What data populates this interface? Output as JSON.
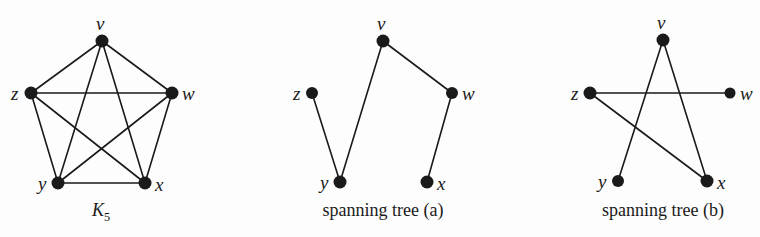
{
  "figure": {
    "background_color": "#fdfdfd",
    "ink_color": "#1a1a1a",
    "panels": [
      {
        "id": "k5",
        "caption": "K",
        "caption_subscript": "5",
        "caption_full": "K5",
        "vertices": [
          {
            "name": "v",
            "label": "v",
            "cx": 102,
            "cy": 41,
            "r": 6.5,
            "label_x": 96,
            "label_y": 14
          },
          {
            "name": "z",
            "label": "z",
            "cx": 31,
            "cy": 93,
            "r": 6.5,
            "label_x": 11,
            "label_y": 84
          },
          {
            "name": "w",
            "label": "w",
            "cx": 172,
            "cy": 93,
            "r": 6.5,
            "label_x": 182,
            "label_y": 84
          },
          {
            "name": "y",
            "label": "y",
            "cx": 58,
            "cy": 183,
            "r": 6.5,
            "label_x": 38,
            "label_y": 174
          },
          {
            "name": "x",
            "label": "x",
            "cx": 145,
            "cy": 183,
            "r": 6.5,
            "label_x": 155,
            "label_y": 175
          }
        ],
        "edges": [
          [
            "v",
            "z"
          ],
          [
            "v",
            "w"
          ],
          [
            "v",
            "y"
          ],
          [
            "v",
            "x"
          ],
          [
            "z",
            "w"
          ],
          [
            "z",
            "y"
          ],
          [
            "z",
            "x"
          ],
          [
            "w",
            "y"
          ],
          [
            "w",
            "x"
          ],
          [
            "y",
            "x"
          ]
        ],
        "edge_count": 10
      },
      {
        "id": "spanning-tree-a",
        "caption": "spanning tree (a)",
        "vertices": [
          {
            "name": "v",
            "label": "v",
            "cx": 383,
            "cy": 41,
            "r": 6.5,
            "label_x": 377,
            "label_y": 14
          },
          {
            "name": "z",
            "label": "z",
            "cx": 312,
            "cy": 93,
            "r": 6.0,
            "label_x": 293,
            "label_y": 84
          },
          {
            "name": "w",
            "label": "w",
            "cx": 452,
            "cy": 93,
            "r": 6.0,
            "label_x": 462,
            "label_y": 84
          },
          {
            "name": "y",
            "label": "y",
            "cx": 340,
            "cy": 182,
            "r": 6.5,
            "label_x": 320,
            "label_y": 173
          },
          {
            "name": "x",
            "label": "x",
            "cx": 427,
            "cy": 182,
            "r": 6.5,
            "label_x": 437,
            "label_y": 174
          }
        ],
        "edges": [
          [
            "z",
            "y"
          ],
          [
            "y",
            "v"
          ],
          [
            "v",
            "w"
          ],
          [
            "w",
            "x"
          ]
        ],
        "edge_count": 4
      },
      {
        "id": "spanning-tree-b",
        "caption": "spanning tree (b)",
        "vertices": [
          {
            "name": "v",
            "label": "v",
            "cx": 663,
            "cy": 40,
            "r": 6.5,
            "label_x": 657,
            "label_y": 13
          },
          {
            "name": "z",
            "label": "z",
            "cx": 590,
            "cy": 93,
            "r": 6.5,
            "label_x": 571,
            "label_y": 84
          },
          {
            "name": "w",
            "label": "w",
            "cx": 730,
            "cy": 93,
            "r": 5.5,
            "label_x": 740,
            "label_y": 84
          },
          {
            "name": "y",
            "label": "y",
            "cx": 618,
            "cy": 181,
            "r": 6.0,
            "label_x": 598,
            "label_y": 172
          },
          {
            "name": "x",
            "label": "x",
            "cx": 707,
            "cy": 181,
            "r": 6.5,
            "label_x": 717,
            "label_y": 173
          }
        ],
        "edges": [
          [
            "z",
            "w"
          ],
          [
            "z",
            "x"
          ],
          [
            "v",
            "y"
          ],
          [
            "v",
            "x"
          ]
        ],
        "edge_count": 4
      }
    ],
    "captions": {
      "k5_x": 101,
      "k5_y": 201,
      "tree_a_x": 383,
      "tree_a_y": 201,
      "tree_b_x": 663,
      "tree_b_y": 201
    }
  }
}
